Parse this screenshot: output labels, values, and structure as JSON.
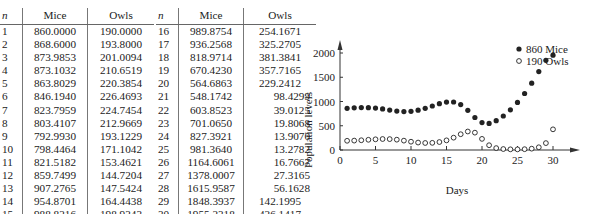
{
  "table": {
    "headers": {
      "n": "n",
      "mice": "Mice",
      "owls": "Owls"
    },
    "left": [
      [
        "1",
        "860.0000",
        "190.0000"
      ],
      [
        "2",
        "868.6000",
        "193.8000"
      ],
      [
        "3",
        "873.9853",
        "201.0094"
      ],
      [
        "4",
        "873.1032",
        "210.6519"
      ],
      [
        "5",
        "863.8029",
        "220.3854"
      ],
      [
        "6",
        "846.1940",
        "226.4693"
      ],
      [
        "7",
        "823.7959",
        "224.7454"
      ],
      [
        "8",
        "803.4107",
        "212.9669"
      ],
      [
        "9",
        "792.9930",
        "193.1229"
      ],
      [
        "10",
        "798.4464",
        "171.1042"
      ],
      [
        "11",
        "821.5182",
        "153.4621"
      ],
      [
        "12",
        "859.7499",
        "144.7204"
      ],
      [
        "13",
        "907.2765",
        "147.5424"
      ],
      [
        "14",
        "954.8701",
        "164.4438"
      ],
      [
        "15",
        "988.8216",
        "198.9343"
      ]
    ],
    "right": [
      [
        "16",
        "989.8754",
        "254.1671"
      ],
      [
        "17",
        "936.2568",
        "325.2705"
      ],
      [
        "18",
        "818.9714",
        "381.3841"
      ],
      [
        "19",
        "670.4230",
        "357.7165"
      ],
      [
        "20",
        "564.6863",
        "229.2412"
      ],
      [
        "21",
        "548.1742",
        "98.4299"
      ],
      [
        "22",
        "603.8523",
        "39.0125"
      ],
      [
        "23",
        "701.0650",
        "19.8068"
      ],
      [
        "24",
        "827.3921",
        "13.9070"
      ],
      [
        "25",
        "981.3640",
        "13.2782"
      ],
      [
        "26",
        "1164.6061",
        "16.7667"
      ],
      [
        "27",
        "1378.0007",
        "27.3165"
      ],
      [
        "28",
        "1615.9587",
        "56.1628"
      ],
      [
        "29",
        "1848.3937",
        "142.1995"
      ],
      [
        "30",
        "1955.2318",
        "426.1417"
      ]
    ]
  },
  "chart_data": {
    "type": "scatter",
    "title": "",
    "xlabel": "Days",
    "ylabel": "Population levels",
    "xlim": [
      0,
      33
    ],
    "ylim": [
      0,
      2500
    ],
    "xticks": [
      0,
      5,
      10,
      15,
      20,
      25,
      30
    ],
    "yticks": [
      0,
      500,
      1000,
      1500,
      2000
    ],
    "grid": false,
    "legend_position": "upper right",
    "x": [
      1,
      2,
      3,
      4,
      5,
      6,
      7,
      8,
      9,
      10,
      11,
      12,
      13,
      14,
      15,
      16,
      17,
      18,
      19,
      20,
      21,
      22,
      23,
      24,
      25,
      26,
      27,
      28,
      29,
      30
    ],
    "series": [
      {
        "name": "860 Mice",
        "marker": "filled-circle",
        "color": "#222222",
        "values": [
          860.0,
          868.6,
          874.0,
          873.1,
          863.8,
          846.2,
          823.8,
          803.4,
          793.0,
          798.4,
          821.5,
          859.7,
          907.3,
          954.9,
          988.8,
          989.9,
          936.3,
          819.0,
          670.4,
          564.7,
          548.2,
          603.9,
          701.1,
          827.4,
          981.4,
          1164.6,
          1378.0,
          1616.0,
          1848.4,
          1955.2
        ]
      },
      {
        "name": "190 Owls",
        "marker": "open-circle",
        "color": "#222222",
        "values": [
          190.0,
          193.8,
          201.0,
          210.7,
          220.4,
          226.5,
          224.7,
          213.0,
          193.1,
          171.1,
          153.5,
          144.7,
          147.5,
          164.4,
          198.9,
          254.2,
          325.3,
          381.4,
          357.7,
          229.2,
          98.4,
          39.0,
          19.8,
          13.9,
          13.3,
          16.8,
          27.3,
          56.2,
          142.2,
          426.1
        ]
      }
    ]
  }
}
